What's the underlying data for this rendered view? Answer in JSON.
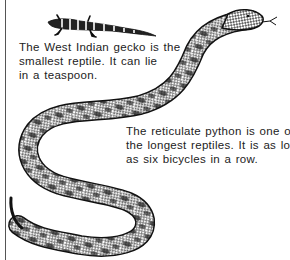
{
  "illustrations": {
    "gecko": {
      "name": "West Indian gecko",
      "icon": "gecko-illustration"
    },
    "python": {
      "name": "reticulate python",
      "icon": "python-illustration"
    }
  },
  "captions": {
    "gecko": {
      "lines": [
        "The West Indian gecko is the",
        "smallest reptile. It can lie",
        "in a teaspoon."
      ]
    },
    "python": {
      "lines": [
        "The reticulate python is one of",
        "the longest reptiles. It is as long",
        "as six bicycles in a row."
      ]
    }
  },
  "colors": {
    "ink": "#222222",
    "background": "#ffffff",
    "rule": "#555555"
  }
}
